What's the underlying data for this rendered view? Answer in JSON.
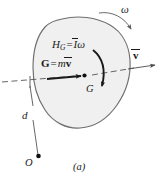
{
  "figure": {
    "caption": "(a)",
    "background_color": "#ffffff",
    "body": {
      "fill_color": "#f0f0f0",
      "stroke_color": "#6e6e6e",
      "shape_name": "irregular-rigid-body-blob"
    },
    "ink_color": "#1a1a1a",
    "dash_color": "#555555"
  },
  "labels": {
    "angular_momentum": {
      "name": "H",
      "subscript": "G",
      "equals": "=",
      "inertia": "I",
      "omega": "ω"
    },
    "linear_momentum": {
      "name": "G",
      "equals": "=",
      "mass": "m",
      "velocity": "v"
    },
    "mass_center": "G",
    "omega": "ω",
    "velocity": "v",
    "distance": "d",
    "reference_point": "O",
    "caption": "(a)"
  },
  "annotations": {
    "linear_momentum_arrow": "momentum vector arrow at G pointing right",
    "angular_momentum_arrow": "clockwise curved arrow about G",
    "omega_arrow": "clockwise curved arrow above body",
    "velocity_arrow": "velocity vector arrow pointing right along dashed axis",
    "axis_line": "dashed horizontal line of motion through G",
    "moment_arm": "dashed vertical segment of length d from axis to O"
  }
}
